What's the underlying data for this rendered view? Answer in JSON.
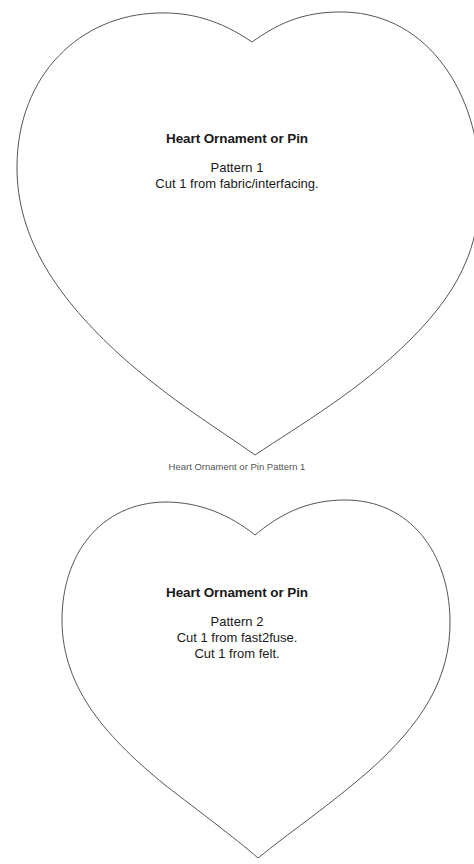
{
  "pattern1": {
    "title": "Heart Ornament or Pin",
    "lines": [
      "Pattern 1",
      "Cut 1 from fabric/interfacing."
    ],
    "caption": "Heart Ornament or Pin Pattern 1"
  },
  "pattern2": {
    "title": "Heart Ornament or Pin",
    "lines": [
      "Pattern 2",
      "Cut 1 from fast2fuse.",
      "Cut 1 from felt."
    ]
  },
  "colors": {
    "outline": "#555555",
    "text": "#1a1a1a",
    "background": "#ffffff"
  }
}
